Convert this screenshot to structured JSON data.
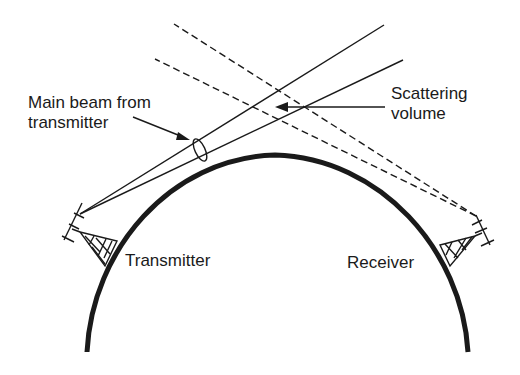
{
  "labels": {
    "main_beam_line1": "Main beam from",
    "main_beam_line2": "transmitter",
    "scattering_line1": "Scattering",
    "scattering_line2": "volume",
    "transmitter": "Transmitter",
    "receiver": "Receiver"
  },
  "colors": {
    "ink": "#1a1a1a",
    "background": "#ffffff"
  }
}
